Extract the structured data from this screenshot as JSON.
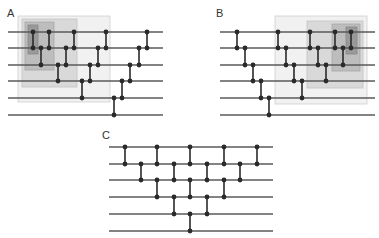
{
  "style": {
    "wire_color": "#5a5a5a",
    "gate_color": "#2a2a2a",
    "dot_radius": 2.4,
    "wire_width": 1.3,
    "gate_width": 1.6
  },
  "panels": [
    {
      "label": "A",
      "label_pos": [
        7,
        17
      ],
      "wire_x": [
        8,
        163
      ],
      "wire_y": [
        32,
        48,
        65,
        81,
        98,
        115
      ],
      "boxes": [
        {
          "x": 18,
          "y": 16,
          "w": 92,
          "h": 86,
          "fill": "#f1f1f1",
          "stroke": "#cfcfcf"
        },
        {
          "x": 22,
          "y": 19,
          "w": 55,
          "h": 68,
          "fill": "#d9d9d9",
          "stroke": "#c2c2c2"
        },
        {
          "x": 25,
          "y": 22,
          "w": 29,
          "h": 48,
          "fill": "#bdbdbd",
          "stroke": "#a9a9a9"
        },
        {
          "x": 28,
          "y": 25,
          "w": 10,
          "h": 29,
          "fill": "#999999",
          "stroke": "#888888"
        }
      ],
      "gates": [
        {
          "x": 33,
          "from": 0,
          "to": 1
        },
        {
          "x": 41,
          "from": 1,
          "to": 2
        },
        {
          "x": 49,
          "from": 0,
          "to": 1
        },
        {
          "x": 58,
          "from": 2,
          "to": 3
        },
        {
          "x": 66,
          "from": 1,
          "to": 2
        },
        {
          "x": 74,
          "from": 0,
          "to": 1
        },
        {
          "x": 82,
          "from": 3,
          "to": 4
        },
        {
          "x": 90,
          "from": 2,
          "to": 3
        },
        {
          "x": 98,
          "from": 1,
          "to": 2
        },
        {
          "x": 106,
          "from": 0,
          "to": 1
        },
        {
          "x": 114,
          "from": 4,
          "to": 5
        },
        {
          "x": 122,
          "from": 3,
          "to": 4
        },
        {
          "x": 130,
          "from": 2,
          "to": 3
        },
        {
          "x": 139,
          "from": 1,
          "to": 2
        },
        {
          "x": 147,
          "from": 0,
          "to": 1
        }
      ]
    },
    {
      "label": "B",
      "label_pos": [
        216,
        17
      ],
      "wire_x": [
        220,
        375
      ],
      "wire_y": [
        32,
        48,
        65,
        81,
        98,
        115
      ],
      "boxes": [
        {
          "x": 275,
          "y": 16,
          "w": 92,
          "h": 88,
          "fill": "#f1f1f1",
          "stroke": "#cfcfcf"
        },
        {
          "x": 307,
          "y": 21,
          "w": 56,
          "h": 67,
          "fill": "#d9d9d9",
          "stroke": "#c2c2c2"
        },
        {
          "x": 332,
          "y": 24,
          "w": 28,
          "h": 47,
          "fill": "#bdbdbd",
          "stroke": "#a9a9a9"
        },
        {
          "x": 346,
          "y": 27,
          "w": 11,
          "h": 27,
          "fill": "#999999",
          "stroke": "#888888"
        }
      ],
      "gates": [
        {
          "x": 237,
          "from": 0,
          "to": 1
        },
        {
          "x": 245,
          "from": 1,
          "to": 2
        },
        {
          "x": 253,
          "from": 2,
          "to": 3
        },
        {
          "x": 261,
          "from": 3,
          "to": 4
        },
        {
          "x": 269,
          "from": 4,
          "to": 5
        },
        {
          "x": 278,
          "from": 0,
          "to": 1
        },
        {
          "x": 286,
          "from": 1,
          "to": 2
        },
        {
          "x": 294,
          "from": 2,
          "to": 3
        },
        {
          "x": 302,
          "from": 3,
          "to": 4
        },
        {
          "x": 310,
          "from": 0,
          "to": 1
        },
        {
          "x": 318,
          "from": 1,
          "to": 2
        },
        {
          "x": 326,
          "from": 2,
          "to": 3
        },
        {
          "x": 335,
          "from": 0,
          "to": 1
        },
        {
          "x": 343,
          "from": 1,
          "to": 2
        },
        {
          "x": 351,
          "from": 0,
          "to": 1
        }
      ]
    },
    {
      "label": "C",
      "label_pos": [
        102,
        139
      ],
      "wire_x": [
        109,
        273
      ],
      "wire_y": [
        147,
        164,
        180,
        197,
        214,
        231
      ],
      "boxes": [],
      "gates": [
        {
          "x": 125,
          "from": 0,
          "to": 1
        },
        {
          "x": 141,
          "from": 1,
          "to": 2
        },
        {
          "x": 157,
          "from": 0,
          "to": 1
        },
        {
          "x": 157,
          "from": 2,
          "to": 3
        },
        {
          "x": 174,
          "from": 1,
          "to": 2
        },
        {
          "x": 174,
          "from": 3,
          "to": 4
        },
        {
          "x": 190,
          "from": 0,
          "to": 1
        },
        {
          "x": 190,
          "from": 2,
          "to": 3
        },
        {
          "x": 190,
          "from": 4,
          "to": 5
        },
        {
          "x": 207,
          "from": 1,
          "to": 2
        },
        {
          "x": 207,
          "from": 3,
          "to": 4
        },
        {
          "x": 224,
          "from": 0,
          "to": 1
        },
        {
          "x": 224,
          "from": 2,
          "to": 3
        },
        {
          "x": 240,
          "from": 1,
          "to": 2
        },
        {
          "x": 257,
          "from": 0,
          "to": 1
        }
      ]
    }
  ]
}
